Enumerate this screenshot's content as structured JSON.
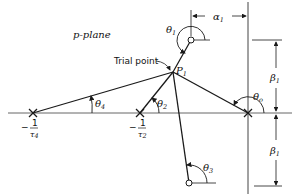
{
  "diagram": {
    "title": "p-plane",
    "trial_point_label": "Trial point",
    "point_label": "P",
    "point_sub": "1",
    "poles": [
      {
        "name": "pole-tau4",
        "label_num": "1",
        "label_den": "τ",
        "label_den_sub": "4",
        "sign": "−"
      },
      {
        "name": "pole-tau2",
        "label_num": "1",
        "label_den": "τ",
        "label_den_sub": "2",
        "sign": "−"
      },
      {
        "name": "pole-origin"
      }
    ],
    "zeros": [
      {
        "name": "zero-upper"
      },
      {
        "name": "zero-lower"
      }
    ],
    "angles": {
      "theta1": {
        "sym": "θ",
        "sub": "1"
      },
      "theta2": {
        "sym": "θ",
        "sub": "2"
      },
      "theta3": {
        "sym": "θ",
        "sub": "3"
      },
      "theta4": {
        "sym": "θ",
        "sub": "4"
      },
      "theta0": {
        "sym": "θ",
        "sub": "o"
      }
    },
    "dimensions": {
      "alpha1": {
        "sym": "α",
        "sub": "1"
      },
      "beta1_upper": {
        "sym": "β",
        "sub": "1"
      },
      "beta1_lower": {
        "sym": "β",
        "sub": "1"
      }
    },
    "colors": {
      "line": "#1a1a1a",
      "axis": "#555555",
      "background": "#ffffff"
    }
  }
}
